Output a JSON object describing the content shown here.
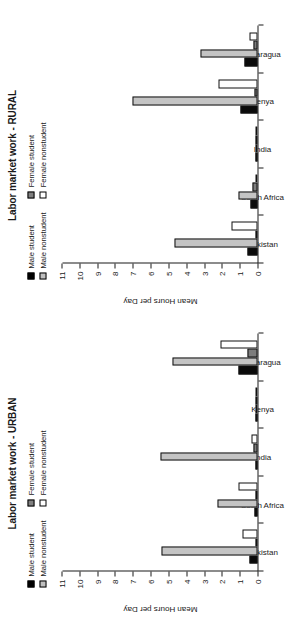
{
  "figure": {
    "rotation": "90deg-ccw",
    "y_axis_label": "Mean Hours per Day",
    "y_ticks": [
      "0",
      "1",
      "2",
      "3",
      "4",
      "5",
      "6",
      "7",
      "8",
      "9",
      "10",
      "11"
    ],
    "categories": [
      "Pakistan",
      "South\nAfrica",
      "India",
      "Kenya",
      "Nicaragua"
    ],
    "legend": {
      "col1": [
        {
          "label": "Male student",
          "key": "male_student",
          "swatch": "sw-ms"
        },
        {
          "label": "Male nonstudent",
          "key": "male_nonstudent",
          "swatch": "sw-mn"
        }
      ],
      "col2": [
        {
          "label": "Female student",
          "key": "female_student",
          "swatch": "sw-fs"
        },
        {
          "label": "Female nonstudent",
          "key": "female_nonstudent",
          "swatch": "sw-fn"
        }
      ]
    },
    "colors": {
      "male_student": "#000000",
      "male_nonstudent": "#c4c4c4",
      "female_student": "#7d7d7d",
      "female_nonstudent": "#ffffff",
      "axis": "#1a1a1a",
      "background": "#ffffff"
    }
  },
  "panels": [
    {
      "id": "urban",
      "title": "Labor market work - URBAN"
    },
    {
      "id": "rural",
      "title": "Labor market work - RURAL"
    }
  ],
  "chart_data": [
    {
      "type": "bar",
      "title": "Labor market work - URBAN",
      "xlabel": "",
      "ylabel": "Mean Hours per Day",
      "ylim": [
        0,
        11
      ],
      "grid": false,
      "legend_position": "top",
      "categories": [
        "Pakistan",
        "South Africa",
        "India",
        "Kenya",
        "Nicaragua"
      ],
      "series": [
        {
          "name": "Male student",
          "values": [
            0.45,
            0.15,
            0.1,
            0.02,
            1.05
          ]
        },
        {
          "name": "Male nonstudent",
          "values": [
            5.4,
            2.25,
            5.45,
            0.05,
            4.8
          ]
        },
        {
          "name": "Female student",
          "values": [
            0.1,
            0.08,
            0.2,
            0.02,
            0.55
          ]
        },
        {
          "name": "Female nonstudent",
          "values": [
            0.85,
            1.1,
            0.35,
            0.05,
            2.1
          ]
        }
      ]
    },
    {
      "type": "bar",
      "title": "Labor market work - RURAL",
      "xlabel": "",
      "ylabel": "Mean Hours per Day",
      "ylim": [
        0,
        11
      ],
      "grid": false,
      "legend_position": "top",
      "categories": [
        "Pakistan",
        "South Africa",
        "India",
        "Kenya",
        "Nicaragua"
      ],
      "series": [
        {
          "name": "Male student",
          "values": [
            0.55,
            0.4,
            0.03,
            0.95,
            0.75
          ]
        },
        {
          "name": "Male nonstudent",
          "values": [
            4.7,
            1.1,
            0.05,
            7.05,
            3.2
          ]
        },
        {
          "name": "Female student",
          "values": [
            0.08,
            0.3,
            0.02,
            0.15,
            0.25
          ]
        },
        {
          "name": "Female nonstudent",
          "values": [
            1.45,
            0.12,
            0.03,
            2.2,
            0.45
          ]
        }
      ]
    }
  ]
}
